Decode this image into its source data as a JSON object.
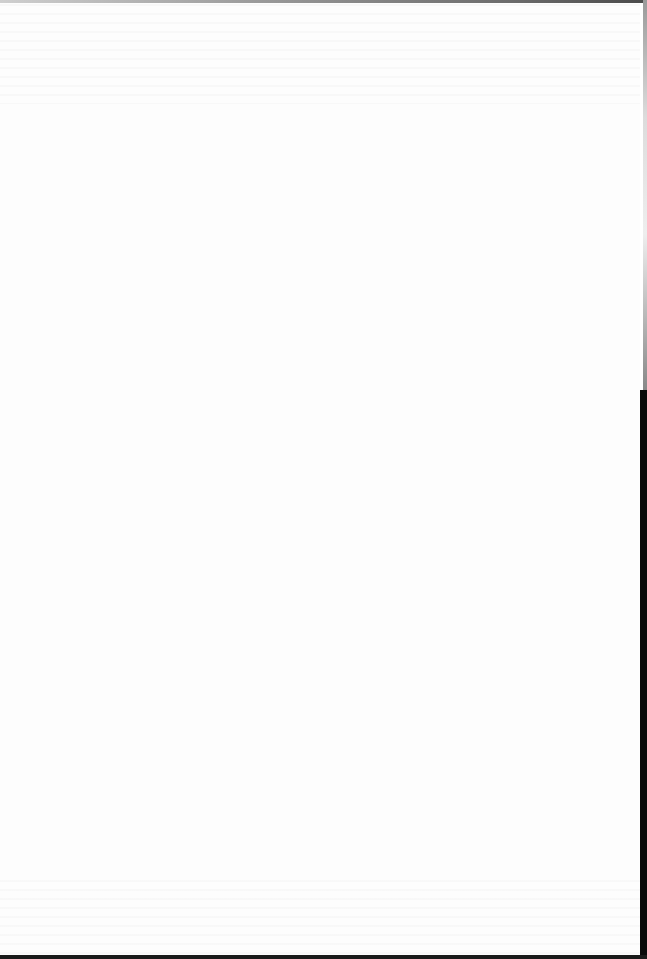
{
  "document": {
    "type": "scanned-page",
    "content": "",
    "colors": {
      "paper": "#fdfdfd",
      "scan_edge": "#0a0a0a"
    }
  }
}
